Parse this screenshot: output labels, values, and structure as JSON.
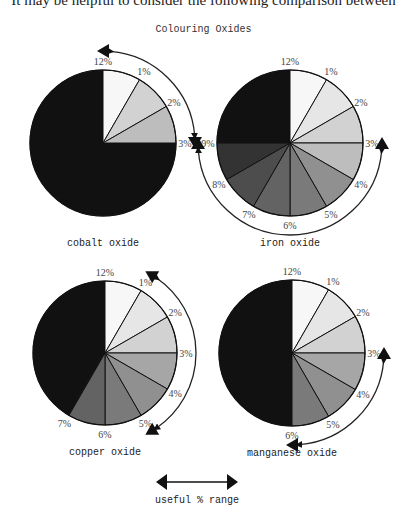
{
  "page": {
    "intro_text": "It may be helpful to consider the following comparison between"
  },
  "chart_data": {
    "type": "pie",
    "title": "Colouring Oxides",
    "scale_labels": [
      "12%",
      "1%",
      "2%",
      "3%",
      "4%",
      "5%",
      "6%",
      "7%",
      "8%",
      "9%"
    ],
    "scale_max_percent": 12,
    "legend": {
      "label": "useful % range",
      "symbol": "double-headed-arrow"
    },
    "colors": {
      "full_strength": "#111111",
      "shades": [
        "#f7f7f7",
        "#e6e6e6",
        "#d2d2d2",
        "#bdbdbd",
        "#a6a6a6",
        "#909090",
        "#7a7a7a",
        "#636363",
        "#4d4d4d",
        "#333333"
      ]
    },
    "pies": [
      {
        "name": "cobalt oxide",
        "shaded_up_to_percent": 3,
        "useful_range": [
          0,
          3
        ],
        "useful_range_labels": [
          "12%",
          "3%"
        ],
        "labels_shown": [
          "12%",
          "1%",
          "2%",
          "3%"
        ],
        "center": [
          103,
          143
        ],
        "radius": 73
      },
      {
        "name": "iron oxide",
        "shaded_up_to_percent": 9,
        "useful_range": [
          3,
          9
        ],
        "useful_range_labels": [
          "3%",
          "9%"
        ],
        "labels_shown": [
          "12%",
          "1%",
          "2%",
          "3%",
          "4%",
          "5%",
          "6%",
          "7%",
          "8%",
          "9%"
        ],
        "center": [
          290,
          143
        ],
        "radius": 73
      },
      {
        "name": "copper oxide",
        "shaded_up_to_percent": 7,
        "useful_range": [
          1,
          5
        ],
        "useful_range_labels": [
          "1%",
          "5%"
        ],
        "labels_shown": [
          "12%",
          "1%",
          "2%",
          "3%",
          "4%",
          "5%",
          "6%",
          "7%"
        ],
        "center": [
          105,
          353
        ],
        "radius": 72
      },
      {
        "name": "manganese oxide",
        "shaded_up_to_percent": 6,
        "useful_range": [
          3,
          6
        ],
        "useful_range_labels": [
          "3%",
          "6%"
        ],
        "labels_shown": [
          "12%",
          "1%",
          "2%",
          "3%",
          "4%",
          "5%",
          "6%"
        ],
        "center": [
          292,
          353
        ],
        "radius": 73
      }
    ]
  }
}
